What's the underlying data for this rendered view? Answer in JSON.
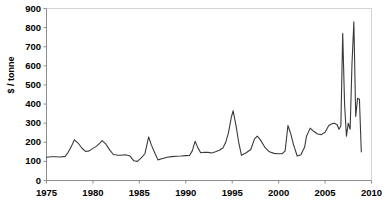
{
  "chart_data": {
    "type": "line",
    "title": "",
    "subtitle": "",
    "xlabel": "",
    "ylabel": "$ / tonne",
    "xlim": [
      1975,
      2010
    ],
    "ylim": [
      0,
      900
    ],
    "grid": false,
    "legend": null,
    "legend_position": "none",
    "x_ticks": [
      "1975",
      "1980",
      "1985",
      "1990",
      "1995",
      "2000",
      "2005",
      "2010"
    ],
    "x_tick_values": [
      1975,
      1980,
      1985,
      1990,
      1995,
      2000,
      2005,
      2010
    ],
    "y_ticks": [
      "0",
      "100",
      "200",
      "300",
      "400",
      "500",
      "600",
      "700",
      "800",
      "900"
    ],
    "y_tick_values": [
      0,
      100,
      200,
      300,
      400,
      500,
      600,
      700,
      800,
      900
    ],
    "line_color": "#3a3a3a",
    "series": [
      {
        "name": "price",
        "x": [
          1975.0,
          1975.5,
          1976.0,
          1976.5,
          1977.0,
          1977.3,
          1977.7,
          1978.0,
          1978.4,
          1978.8,
          1979.2,
          1979.6,
          1980.0,
          1980.4,
          1980.8,
          1981.0,
          1981.4,
          1981.8,
          1982.2,
          1982.6,
          1983.0,
          1983.5,
          1984.0,
          1984.4,
          1984.8,
          1985.2,
          1985.6,
          1986.0,
          1986.3,
          1986.7,
          1987.0,
          1987.5,
          1988.0,
          1988.5,
          1989.0,
          1989.5,
          1990.0,
          1990.4,
          1990.7,
          1991.0,
          1991.3,
          1991.6,
          1992.0,
          1992.4,
          1992.8,
          1993.2,
          1993.6,
          1994.0,
          1994.3,
          1994.6,
          1994.9,
          1995.1,
          1995.4,
          1995.7,
          1996.0,
          1996.5,
          1997.0,
          1997.4,
          1997.7,
          1998.0,
          1998.5,
          1999.0,
          1999.5,
          2000.0,
          2000.4,
          2000.7,
          2001.0,
          2001.3,
          2001.6,
          2002.0,
          2002.4,
          2002.8,
          2003.0,
          2003.4,
          2003.8,
          2004.2,
          2004.6,
          2005.0,
          2005.4,
          2005.8,
          2006.0,
          2006.3,
          2006.5,
          2006.7,
          2006.9,
          2007.1,
          2007.3,
          2007.5,
          2007.7,
          2007.9,
          2008.1,
          2008.3,
          2008.5,
          2008.7,
          2008.9
        ],
        "values": [
          122,
          124,
          124,
          123,
          126,
          145,
          180,
          213,
          196,
          170,
          152,
          155,
          168,
          180,
          198,
          209,
          190,
          160,
          136,
          133,
          132,
          135,
          128,
          103,
          100,
          118,
          140,
          228,
          185,
          140,
          108,
          115,
          122,
          125,
          127,
          128,
          130,
          131,
          155,
          205,
          172,
          145,
          148,
          147,
          144,
          150,
          158,
          170,
          200,
          250,
          330,
          365,
          290,
          200,
          132,
          145,
          162,
          218,
          232,
          215,
          175,
          150,
          142,
          140,
          140,
          155,
          288,
          245,
          188,
          128,
          135,
          175,
          232,
          274,
          256,
          243,
          240,
          252,
          288,
          298,
          299,
          292,
          268,
          285,
          770,
          400,
          232,
          300,
          268,
          612,
          830,
          335,
          430,
          425,
          150
        ]
      }
    ]
  }
}
